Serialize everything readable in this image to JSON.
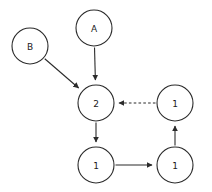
{
  "diagram": {
    "title": "",
    "canvas": {
      "width": 212,
      "height": 192,
      "background": "#ffffff"
    },
    "stroke_color": "#2b2b2b",
    "label_color": "#1a1a1a",
    "node_radius": 18,
    "nodes": [
      {
        "id": "B",
        "label": "B",
        "cx": 30,
        "cy": 46,
        "r": 18
      },
      {
        "id": "A",
        "label": "A",
        "cx": 94,
        "cy": 28,
        "r": 18
      },
      {
        "id": "C2",
        "label": "2",
        "cx": 96,
        "cy": 103,
        "r": 18
      },
      {
        "id": "TR",
        "label": "1",
        "cx": 175,
        "cy": 103,
        "r": 18
      },
      {
        "id": "BL",
        "label": "1",
        "cx": 96,
        "cy": 165,
        "r": 18
      },
      {
        "id": "BR",
        "label": "1",
        "cx": 175,
        "cy": 165,
        "r": 18
      }
    ],
    "edges": [
      {
        "id": "B-to-2",
        "from": "B",
        "to": "C2",
        "style": "solid",
        "arrow": "end"
      },
      {
        "id": "A-to-2",
        "from": "A",
        "to": "C2",
        "style": "solid",
        "arrow": "end"
      },
      {
        "id": "TR-to-2",
        "from": "TR",
        "to": "C2",
        "style": "dashed",
        "arrow": "end"
      },
      {
        "id": "2-to-BL",
        "from": "C2",
        "to": "BL",
        "style": "solid",
        "arrow": "end"
      },
      {
        "id": "BL-to-BR",
        "from": "BL",
        "to": "BR",
        "style": "solid",
        "arrow": "end"
      },
      {
        "id": "BR-to-TR",
        "from": "BR",
        "to": "TR",
        "style": "solid",
        "arrow": "end"
      }
    ]
  }
}
